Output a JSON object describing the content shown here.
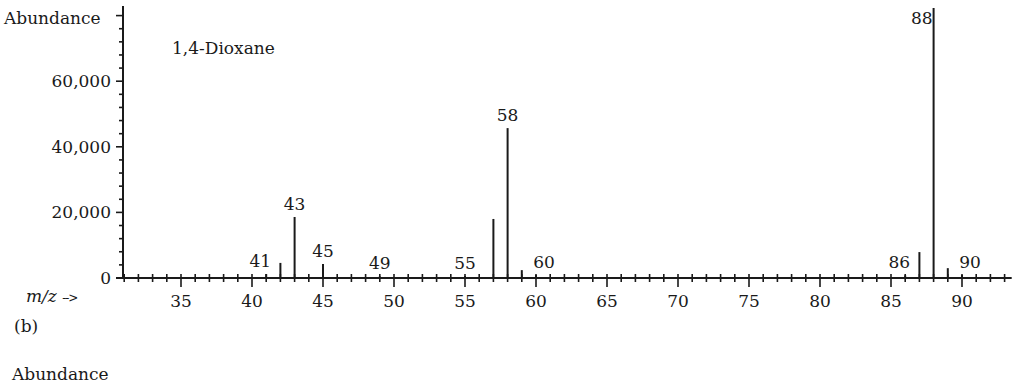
{
  "chart_data": {
    "type": "bar",
    "title": "1,4-Dioxane",
    "xlabel": "m/z",
    "ylabel": "Abundance",
    "xlim": [
      31,
      93.5
    ],
    "ylim": [
      0,
      82500
    ],
    "xticks_major": [
      35,
      40,
      45,
      50,
      55,
      60,
      65,
      70,
      75,
      80,
      85,
      90
    ],
    "yticks_major": [
      0,
      20000,
      40000,
      60000
    ],
    "ytick_labels": [
      "0",
      "20,000",
      "40,000",
      "60,000"
    ],
    "grid": false,
    "peaks": [
      {
        "mz": 41,
        "abundance": 1200,
        "label": "41"
      },
      {
        "mz": 42,
        "abundance": 4600,
        "label": ""
      },
      {
        "mz": 43,
        "abundance": 18600,
        "label": "43"
      },
      {
        "mz": 45,
        "abundance": 4300,
        "label": "45"
      },
      {
        "mz": 49,
        "abundance": 500,
        "label": "49"
      },
      {
        "mz": 55,
        "abundance": 600,
        "label": "55"
      },
      {
        "mz": 57,
        "abundance": 18000,
        "label": ""
      },
      {
        "mz": 58,
        "abundance": 45700,
        "label": "58"
      },
      {
        "mz": 59,
        "abundance": 2400,
        "label": ""
      },
      {
        "mz": 60,
        "abundance": 900,
        "label": "60"
      },
      {
        "mz": 86,
        "abundance": 800,
        "label": "86"
      },
      {
        "mz": 87,
        "abundance": 7900,
        "label": ""
      },
      {
        "mz": 88,
        "abundance": 82300,
        "label": "88"
      },
      {
        "mz": 89,
        "abundance": 3000,
        "label": ""
      },
      {
        "mz": 90,
        "abundance": 900,
        "label": "90"
      }
    ]
  },
  "labels": {
    "y_axis": "Abundance",
    "compound": "1,4-Dioxane",
    "x_axis": "m/z",
    "x_arrow": "-->",
    "panel": "(b)",
    "next_panel_partial": "Abundance"
  }
}
